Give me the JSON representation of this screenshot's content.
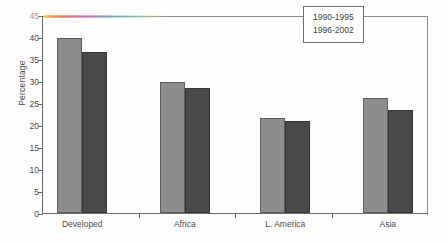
{
  "chart_data": {
    "type": "bar",
    "title": "",
    "xlabel": "",
    "ylabel": "Percentage",
    "ylim": [
      0,
      45
    ],
    "yticks": [
      0,
      5,
      10,
      15,
      20,
      25,
      30,
      35,
      40,
      45
    ],
    "grid": false,
    "legend_position": "top-right",
    "categories": [
      "Developed",
      "Africa",
      "L. America",
      "Asia"
    ],
    "series": [
      {
        "name": "1990-1995",
        "values": [
          39.7,
          29.8,
          21.7,
          26.1
        ],
        "color": "#8d8d8d"
      },
      {
        "name": "1996-2002",
        "values": [
          36.7,
          28.5,
          20.8,
          23.5
        ],
        "color": "#494949"
      }
    ]
  },
  "axis": {
    "ylabel": "Percentage",
    "tick_labels": [
      "0",
      "5",
      "10",
      "15",
      "20",
      "25",
      "30",
      "35",
      "40",
      "45"
    ],
    "top_tick_faded": true
  },
  "legend": {
    "entries": [
      "1990-1995",
      "1996-2002"
    ]
  }
}
